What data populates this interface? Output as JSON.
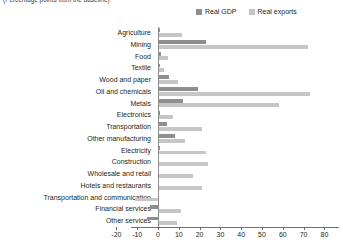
{
  "subtitle": "(Percentage points from the baseline)",
  "legend": {
    "position": "top-right",
    "items": [
      {
        "label": "Real GDP",
        "color": "#8e8e8e",
        "swatch": "legend-swatch"
      },
      {
        "label": "Real exports",
        "color": "#c6c6c6",
        "swatch": "legend-swatch"
      }
    ]
  },
  "chart_data": {
    "type": "bar",
    "orientation": "horizontal",
    "title": "",
    "subtitle": "(Percentage points from the baseline)",
    "xlabel": "",
    "ylabel": "",
    "xlim": [
      -20,
      80
    ],
    "xticks": [
      -20,
      -10,
      0,
      10,
      20,
      30,
      40,
      50,
      60,
      70,
      80
    ],
    "xtick_labels": [
      "-20",
      "-10",
      "0",
      "10",
      "20",
      "30",
      "40",
      "50",
      "60",
      "70",
      "80"
    ],
    "grid": false,
    "zero_line": 0,
    "categories": [
      "Agriculture",
      "Mining",
      "Food",
      "Textile",
      "Wood and paper",
      "Oil and chemicals",
      "Metals",
      "Electronics",
      "Transportation",
      "Other manufacturing",
      "Electricity",
      "Construction",
      "Wholesale and retail",
      "Hotels and restaurants",
      "Transportation and communication",
      "Financial services",
      "Other services"
    ],
    "series": [
      {
        "name": "Real GDP",
        "color": "#8e8e8e",
        "values": [
          0.8,
          23.0,
          1.5,
          1.0,
          5.5,
          19.0,
          12.0,
          1.2,
          4.5,
          8.0,
          1.0,
          0.7,
          0.6,
          0.5,
          0.4,
          -4.0,
          -5.5
        ]
      },
      {
        "name": "Real exports",
        "color": "#c6c6c6",
        "values": [
          11.5,
          72.0,
          5.0,
          3.0,
          9.5,
          73.0,
          58.0,
          7.0,
          21.0,
          13.0,
          23.0,
          24.0,
          17.0,
          21.0,
          -11.0,
          11.0,
          9.0
        ]
      }
    ]
  }
}
